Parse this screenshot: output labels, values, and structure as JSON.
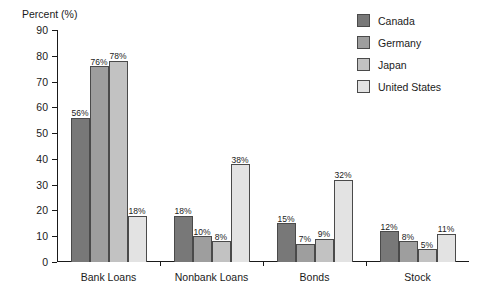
{
  "chart_data": {
    "type": "bar",
    "title": "",
    "ylabel": "Percent (%)",
    "xlabel": "",
    "ylim": [
      0,
      90
    ],
    "ytick_step": 10,
    "yticks": [
      0,
      10,
      20,
      30,
      40,
      50,
      60,
      70,
      80,
      90
    ],
    "grid": false,
    "legend_position": "top-right",
    "value_label_suffix": "%",
    "categories": [
      "Bank Loans",
      "Nonbank Loans",
      "Bonds",
      "Stock"
    ],
    "series": [
      {
        "name": "Canada",
        "color": "#787878",
        "values": [
          56,
          18,
          15,
          12
        ],
        "labels": [
          "56%",
          "18%",
          "15%",
          "12%"
        ]
      },
      {
        "name": "Germany",
        "color": "#9e9e9e",
        "values": [
          76,
          10,
          7,
          8
        ],
        "labels": [
          "76%",
          "10%",
          "7%",
          "8%"
        ]
      },
      {
        "name": "Japan",
        "color": "#c2c2c2",
        "values": [
          78,
          8,
          9,
          5
        ],
        "labels": [
          "78%",
          "8%",
          "9%",
          "5%"
        ]
      },
      {
        "name": "United States",
        "color": "#e3e3e3",
        "values": [
          18,
          38,
          32,
          11
        ],
        "labels": [
          "18%",
          "38%",
          "32%",
          "11%"
        ]
      }
    ]
  }
}
